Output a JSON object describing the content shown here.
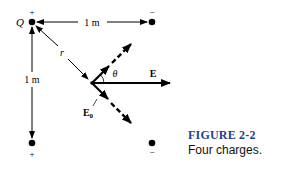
{
  "figure": {
    "charges": [
      {
        "id": "Q",
        "sign": "+",
        "label": "Q",
        "position": "top-left"
      },
      {
        "id": "top-right",
        "sign": "−",
        "position": "top-right"
      },
      {
        "id": "bottom-left",
        "sign": "+",
        "position": "bottom-left"
      },
      {
        "id": "bottom-right",
        "sign": "−",
        "position": "bottom-right"
      }
    ],
    "labels": {
      "q": "Q",
      "top_distance": "1 m",
      "left_distance": "1 m",
      "r": "r",
      "theta": "θ",
      "e": "E",
      "e0_main": "E",
      "e0_sub": "0",
      "plus": "+",
      "minus": "−"
    }
  },
  "caption": {
    "title": "FIGURE 2-2",
    "text": "Four charges."
  },
  "colors": {
    "ink": "#000000",
    "caption_title": "#1f3f8f"
  }
}
